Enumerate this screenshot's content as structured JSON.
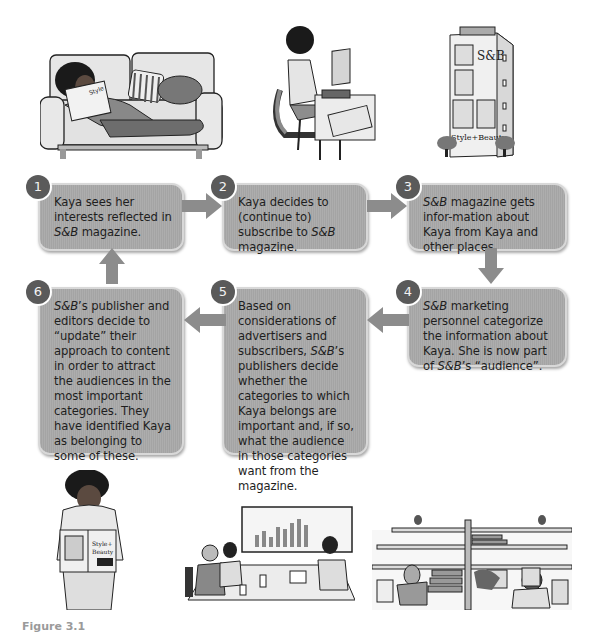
{
  "diagram": {
    "type": "cyclic flow diagram",
    "steps": [
      {
        "number": "1",
        "parts": [
          {
            "t": "Kaya sees her interests reflected in "
          },
          {
            "t": "S&B",
            "i": true
          },
          {
            "t": " magazine."
          }
        ]
      },
      {
        "number": "2",
        "parts": [
          {
            "t": "Kaya decides to (continue to) subscribe to "
          },
          {
            "t": "S&B",
            "i": true
          },
          {
            "t": " magazine."
          }
        ]
      },
      {
        "number": "3",
        "parts": [
          {
            "t": "S&B",
            "i": true
          },
          {
            "t": " magazine gets infor-mation about Kaya from Kaya and other places."
          }
        ]
      },
      {
        "number": "4",
        "parts": [
          {
            "t": "S&B",
            "i": true
          },
          {
            "t": " marketing personnel categorize the information about Kaya. She is now part of "
          },
          {
            "t": "S&B",
            "i": true
          },
          {
            "t": "’s “audience”."
          }
        ]
      },
      {
        "number": "5",
        "parts": [
          {
            "t": "Based on considerations of advertisers and subscribers, "
          },
          {
            "t": "S&B",
            "i": true
          },
          {
            "t": "’s publishers decide whether the categories to which Kaya belongs are important and, if so, what the audience in those categories want from the magazine."
          }
        ]
      },
      {
        "number": "6",
        "parts": [
          {
            "t": "S&B",
            "i": true
          },
          {
            "t": "’s publisher and editors decide to “update” their approach to content in order to attract the audiences in the most important categories. They have identified Kaya as belonging to some of these."
          }
        ]
      }
    ],
    "flow": [
      "1→2",
      "2→3",
      "3→4",
      "4→5",
      "5→6",
      "6→1"
    ],
    "illustrations": [
      {
        "name": "woman-reading-on-sofa",
        "magazine_text": "Style+Beauty"
      },
      {
        "name": "woman-at-laptop",
        "magazine_text": "Style+Beauty"
      },
      {
        "name": "magazine-office-building",
        "sign_top": "S&B",
        "sign_bottom": "Style+Beauty"
      },
      {
        "name": "woman-holding-magazine",
        "magazine_text": "Style+Beauty"
      },
      {
        "name": "meeting-with-bar-chart-screen"
      },
      {
        "name": "office-cubicles"
      }
    ],
    "colors": {
      "box_fill": "#a9a9a9",
      "box_border": "#d8d8d8",
      "number_badge": "#5a5a5a",
      "arrow": "#8c8c8c",
      "text": "#1e1e1e"
    }
  },
  "caption": "Figure 3.1"
}
